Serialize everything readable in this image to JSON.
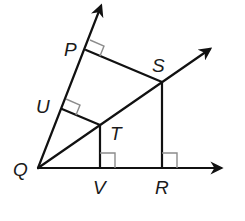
{
  "diagram": {
    "type": "geometry",
    "colors": {
      "line": "#111111",
      "right_angle_marker": "#8c8c8c",
      "label": "#1a1a1a",
      "background": "#ffffff"
    },
    "points": {
      "Q": {
        "label": "Q",
        "x": 38,
        "y": 168
      },
      "P": {
        "label": "P",
        "x": 86,
        "y": 50
      },
      "U": {
        "label": "U",
        "x": 62,
        "y": 109
      },
      "S": {
        "label": "S",
        "x": 162,
        "y": 82
      },
      "T": {
        "label": "T",
        "x": 100,
        "y": 125
      },
      "V": {
        "label": "V",
        "x": 100,
        "y": 168
      },
      "R": {
        "label": "R",
        "x": 162,
        "y": 168
      }
    },
    "rays": [
      {
        "from": "Q",
        "through": "P",
        "arrow_tip": [
          103,
          2
        ]
      },
      {
        "from": "Q",
        "through": "S",
        "arrow_tip": [
          213,
          47
        ]
      },
      {
        "from": "Q",
        "through": "R",
        "arrow_tip": [
          225,
          168
        ]
      }
    ],
    "segments": [
      {
        "from": "P",
        "to": "S"
      },
      {
        "from": "U",
        "to": "T"
      },
      {
        "from": "T",
        "to": "V"
      },
      {
        "from": "S",
        "to": "R"
      }
    ],
    "right_angles": [
      "P",
      "U",
      "V",
      "R"
    ]
  }
}
